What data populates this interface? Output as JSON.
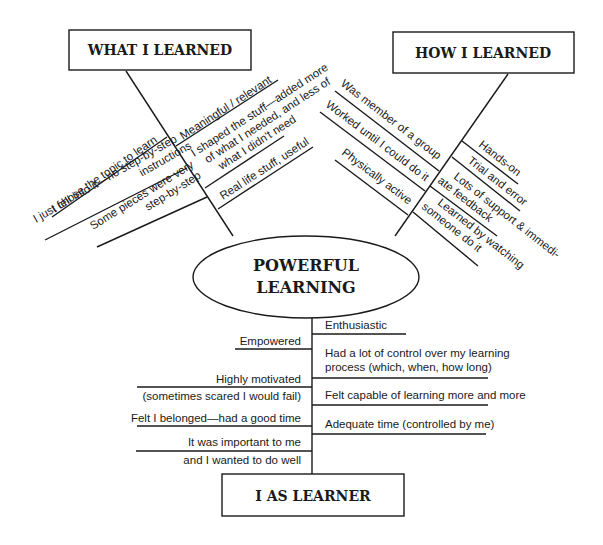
{
  "diagram": {
    "center": {
      "line1": "POWERFUL",
      "line2": "LEARNING"
    },
    "what_i_learned": {
      "title": "WHAT I LEARNED",
      "outer_branches": [
        {
          "lines": [
            "I chose the topic to learn"
          ]
        },
        {
          "lines": [
            "I just fell into it—no step-by-step",
            "instructions"
          ]
        },
        {
          "lines": [
            "Some pieces were very",
            "step-by-step"
          ]
        }
      ],
      "inner_branches": [
        {
          "lines": [
            "Meaningful / relevant"
          ]
        },
        {
          "lines": [
            "I shaped the stuff—added more",
            "of what I needed, and less of",
            "what I didn't need"
          ]
        },
        {
          "lines": [
            "Real life stuff, useful"
          ]
        }
      ]
    },
    "how_i_learned": {
      "title": "HOW I LEARNED",
      "outer_branches": [
        {
          "lines": [
            "Was member of a group"
          ]
        },
        {
          "lines": [
            "Worked until I could do it"
          ]
        },
        {
          "lines": [
            "Physically active"
          ]
        }
      ],
      "inner_branches": [
        {
          "lines": [
            "Hands-on"
          ]
        },
        {
          "lines": [
            "Trial and error"
          ]
        },
        {
          "lines": [
            "Lots of support & immedi-",
            "ate feedback"
          ]
        },
        {
          "lines": [
            "Learned by watching",
            "someone do it"
          ]
        }
      ]
    },
    "i_as_learner": {
      "title": "I AS LEARNER",
      "left_branches": [
        {
          "lines": [
            "Empowered"
          ]
        },
        {
          "lines": [
            "Highly motivated",
            "(sometimes scared I would fail)"
          ]
        },
        {
          "lines": [
            "Felt I belonged—had a good time"
          ]
        },
        {
          "lines": [
            "It was important to me",
            "and I wanted to do well"
          ]
        }
      ],
      "right_branches": [
        {
          "lines": [
            "Enthusiastic"
          ]
        },
        {
          "lines": [
            "Had a lot of control over my learning",
            "process (which, when, how long)"
          ]
        },
        {
          "lines": [
            "Felt capable of learning more and more"
          ]
        },
        {
          "lines": [
            "Adequate time (controlled by me)"
          ]
        }
      ]
    }
  }
}
